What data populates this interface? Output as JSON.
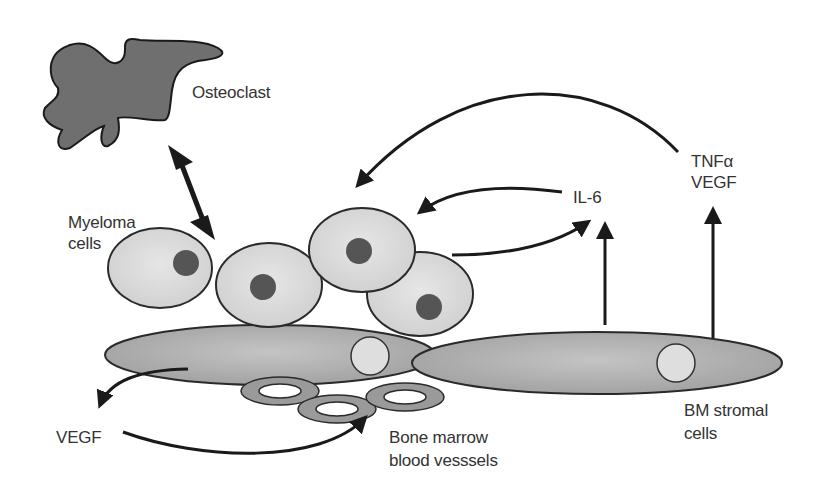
{
  "diagram": {
    "labels": {
      "osteoclast": "Osteoclast",
      "myeloma_line1": "Myeloma",
      "myeloma_line2": "cells",
      "il6": "IL-6",
      "tnf_line1": "TNFα",
      "tnf_line2": "VEGF",
      "vegf": "VEGF",
      "vessels_line1": "Bone marrow",
      "vessels_line2": "blood vesssels",
      "stromal_line1": "BM stromal",
      "stromal_line2": "cells"
    },
    "colors": {
      "osteoclast_fill": "#6f6f6f",
      "myeloma_fill": "#dcdcdc",
      "nucleus_fill": "#555555",
      "stromal_fill": "#b4b4b4",
      "vessel_fill": "#9a9a9a",
      "arrow": "#1a1a1a"
    }
  }
}
